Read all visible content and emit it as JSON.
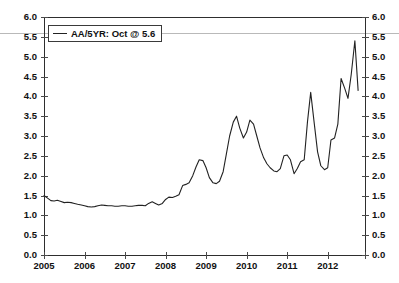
{
  "chart_data": {
    "type": "line",
    "title": "",
    "subtitle": "",
    "xlabel": "",
    "ylabel": "",
    "xlim": [
      2005.0,
      2012.92
    ],
    "ylim": [
      0.0,
      6.0
    ],
    "grid": false,
    "legend_position": "top-left",
    "y_ticks": [
      "0.0",
      "0.5",
      "1.0",
      "1.5",
      "2.0",
      "2.5",
      "3.0",
      "3.5",
      "4.0",
      "4.5",
      "5.0",
      "5.5",
      "6.0"
    ],
    "y_tick_values": [
      0.0,
      0.5,
      1.0,
      1.5,
      2.0,
      2.5,
      3.0,
      3.5,
      4.0,
      4.5,
      5.0,
      5.5,
      6.0
    ],
    "x_ticks": [
      "2005",
      "2006",
      "2007",
      "2008",
      "2009",
      "2010",
      "2011",
      "2012"
    ],
    "x_tick_values": [
      2005,
      2006,
      2007,
      2008,
      2009,
      2010,
      2011,
      2012
    ],
    "dual_y_axis": true,
    "annotations": [
      {
        "type": "hline",
        "value": 5.6,
        "color": "#b9b9b9",
        "label": "Oct @ 5.6"
      }
    ],
    "series": [
      {
        "name": "AA/5YR",
        "legend_label": "AA/5YR: Oct @ 5.6",
        "color": "#222222",
        "last_value": 5.6,
        "last_period": "Oct",
        "x": [
          2005.0,
          2005.08,
          2005.17,
          2005.25,
          2005.33,
          2005.42,
          2005.5,
          2005.58,
          2005.67,
          2005.75,
          2005.83,
          2005.92,
          2006.0,
          2006.08,
          2006.17,
          2006.25,
          2006.33,
          2006.42,
          2006.5,
          2006.58,
          2006.67,
          2006.75,
          2006.83,
          2006.92,
          2007.0,
          2007.08,
          2007.17,
          2007.25,
          2007.33,
          2007.42,
          2007.5,
          2007.58,
          2007.67,
          2007.75,
          2007.83,
          2007.92,
          2008.0,
          2008.08,
          2008.17,
          2008.25,
          2008.33,
          2008.42,
          2008.5,
          2008.58,
          2008.67,
          2008.75,
          2008.83,
          2008.92,
          2009.0,
          2009.08,
          2009.17,
          2009.25,
          2009.33,
          2009.42,
          2009.5,
          2009.58,
          2009.67,
          2009.75,
          2009.83,
          2009.92,
          2010.0,
          2010.08,
          2010.17,
          2010.25,
          2010.33,
          2010.42,
          2010.5,
          2010.58,
          2010.67,
          2010.75,
          2010.83,
          2010.92,
          2011.0,
          2011.08,
          2011.17,
          2011.25,
          2011.33,
          2011.42,
          2011.5,
          2011.58,
          2011.67,
          2011.75,
          2011.83,
          2011.92,
          2012.0,
          2012.08,
          2012.17,
          2012.25,
          2012.33,
          2012.42,
          2012.5,
          2012.58,
          2012.67,
          2012.75
        ],
        "y": [
          1.5,
          1.44,
          1.37,
          1.36,
          1.38,
          1.35,
          1.32,
          1.33,
          1.32,
          1.3,
          1.28,
          1.26,
          1.24,
          1.22,
          1.21,
          1.22,
          1.24,
          1.26,
          1.25,
          1.24,
          1.24,
          1.23,
          1.23,
          1.24,
          1.24,
          1.23,
          1.23,
          1.24,
          1.25,
          1.25,
          1.24,
          1.3,
          1.34,
          1.3,
          1.26,
          1.3,
          1.4,
          1.46,
          1.45,
          1.48,
          1.52,
          1.75,
          1.78,
          1.82,
          2.0,
          2.22,
          2.4,
          2.38,
          2.2,
          1.95,
          1.82,
          1.8,
          1.86,
          2.1,
          2.55,
          3.0,
          3.35,
          3.5,
          3.2,
          2.95,
          3.1,
          3.4,
          3.3,
          3.0,
          2.7,
          2.45,
          2.3,
          2.2,
          2.12,
          2.1,
          2.18,
          2.5,
          2.52,
          2.4,
          2.05,
          2.18,
          2.35,
          2.4,
          3.35,
          4.1,
          3.3,
          2.6,
          2.25,
          2.15,
          2.2,
          2.9,
          2.95,
          3.3,
          4.45,
          4.2,
          3.95,
          4.55,
          5.4,
          4.15
        ]
      }
    ]
  },
  "legend": {
    "entries": [
      {
        "label": "AA/5YR: Oct @ 5.6",
        "swatch": "line-swatch"
      }
    ]
  },
  "axes": {
    "left_labels": [
      "6.0",
      "5.5",
      "5.0",
      "4.5",
      "4.0",
      "3.5",
      "3.0",
      "2.5",
      "2.0",
      "1.5",
      "1.0",
      "0.5",
      "0.0"
    ],
    "right_labels": [
      "6.0",
      "5.5",
      "5.0",
      "4.5",
      "4.0",
      "3.5",
      "3.0",
      "2.5",
      "2.0",
      "1.5",
      "1.0",
      "0.5",
      "0.0"
    ],
    "bottom_labels": [
      "2005",
      "2006",
      "2007",
      "2008",
      "2009",
      "2010",
      "2011",
      "2012"
    ]
  },
  "colors": {
    "series_line": "#222222",
    "reference_line": "#b9b9b9",
    "axis": "#2e2e2e",
    "text": "#111111",
    "background": "#ffffff"
  }
}
